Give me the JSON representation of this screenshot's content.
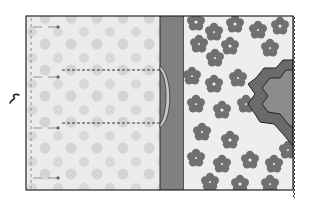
{
  "diagram": {
    "type": "sewing-instruction-illustration",
    "colors": {
      "background": "#ffffff",
      "light_panel": "#e9e9e9",
      "dot": "#d6d6d6",
      "gray_strip": "#7f7f7f",
      "floral_bg": "#ebebeb",
      "flower_dark": "#6f6f6f",
      "flower_mid": "#8a8a8a",
      "flower_center": "#f2f2f2",
      "hex_outer": "#6a6a6a",
      "hex_inner": "#8c8c8c",
      "outline": "#2a2a2a",
      "curve_fill": "#c9c9c9"
    },
    "frame": {
      "x": 26,
      "y": 16,
      "w": 267,
      "h": 174
    },
    "panels": [
      {
        "name": "polka-dot-panel",
        "x": 26,
        "y": 16,
        "w": 134,
        "h": 174
      },
      {
        "name": "gray-binding-strip",
        "x": 160,
        "y": 16,
        "w": 24,
        "h": 174
      },
      {
        "name": "floral-panel",
        "x": 184,
        "y": 16,
        "w": 109,
        "h": 174
      }
    ],
    "pin_markers": [
      {
        "y": 27
      },
      {
        "y": 77
      },
      {
        "y": 127
      },
      {
        "y": 178
      }
    ],
    "dashed_stitch_lines": [
      {
        "y": 70,
        "x1": 62,
        "x2": 160
      },
      {
        "y": 123,
        "x1": 62,
        "x2": 160
      }
    ],
    "hexagon_shape": {
      "side": "right",
      "y_top": 60,
      "y_bottom": 146
    },
    "fold_symbol": {
      "x": 14,
      "y": 98
    }
  }
}
